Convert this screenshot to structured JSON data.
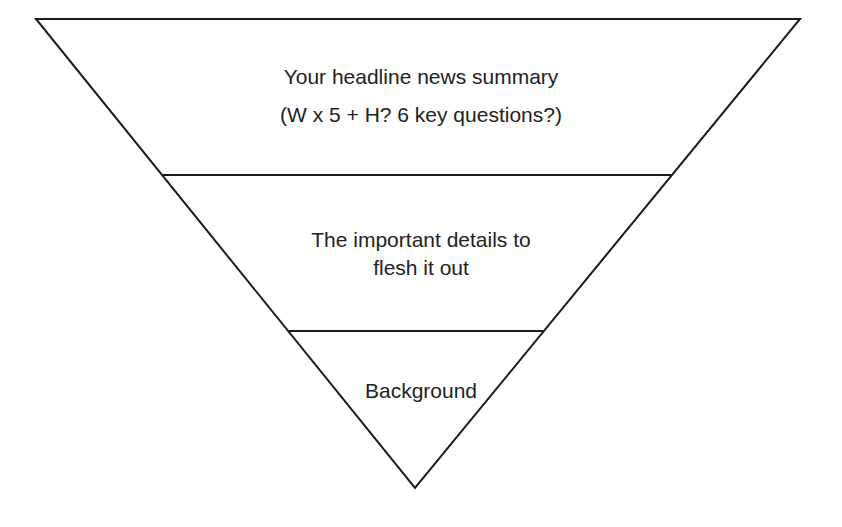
{
  "diagram": {
    "type": "inverted-pyramid",
    "colors": {
      "stroke": "#1a1a1a",
      "fill": "#ffffff",
      "text": "#222222"
    },
    "layers": [
      {
        "name": "headline",
        "lines": [
          "Your headline news summary",
          "(W x 5 + H? 6 key questions?)"
        ]
      },
      {
        "name": "details",
        "lines": [
          "The important details to",
          "flesh it out"
        ]
      },
      {
        "name": "background",
        "lines": [
          "Background"
        ]
      }
    ]
  }
}
